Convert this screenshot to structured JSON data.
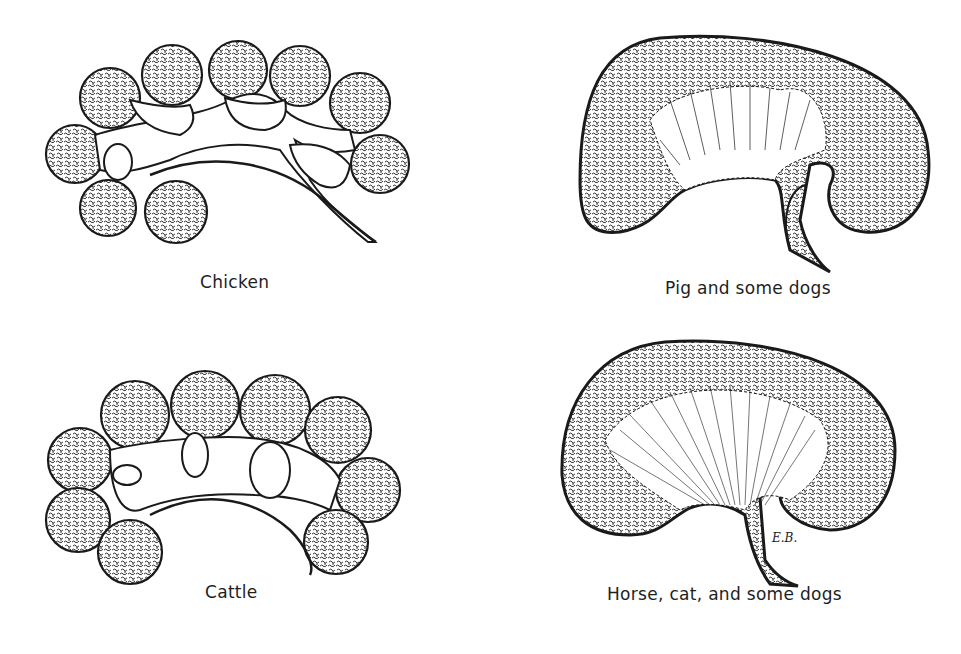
{
  "figure": {
    "panels": [
      {
        "id": "chicken",
        "label": "Chicken",
        "kidney_type": "multilobed-small-lobules",
        "lobe_count": 9
      },
      {
        "id": "pig",
        "label": "Pig and some dogs",
        "kidney_type": "unipyramidal-multiple-papillae"
      },
      {
        "id": "cattle",
        "label": "Cattle",
        "kidney_type": "lobated",
        "lobe_count": 10
      },
      {
        "id": "horse",
        "label": "Horse, cat, and some dogs",
        "kidney_type": "unipyramidal-crest"
      }
    ],
    "signature": "E.B.",
    "colors": {
      "ink": "#1a1a1a",
      "background": "#ffffff"
    }
  }
}
